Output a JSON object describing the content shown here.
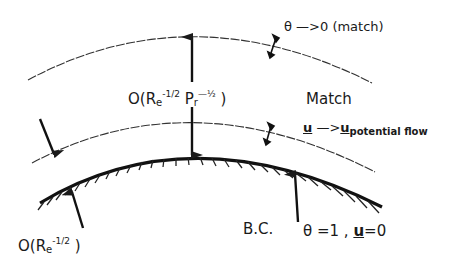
{
  "diagram": {
    "type": "boundary-layer schematic",
    "labels": {
      "outer_condition": "θ —>0 (match)",
      "thermal_thickness_prefix": "O(R",
      "thermal_thickness_sub": "e",
      "thermal_thickness_exp1": "-1/2",
      "thermal_thickness_mid": " P",
      "thermal_thickness_sub2": "r",
      "thermal_thickness_exp2": "—½",
      "thermal_thickness_suffix": " )",
      "match": "Match",
      "velocity_u": "u",
      "velocity_arrow": " —>",
      "velocity_u2": "u",
      "velocity_sub": "potential flow",
      "momentum_thickness_prefix": "O(R",
      "momentum_thickness_sub": "e",
      "momentum_thickness_exp": "-1/2",
      "momentum_thickness_suffix": " )",
      "bc": "B.C.",
      "bc_values_theta": "θ =1 , ",
      "bc_values_u": "u",
      "bc_values_rest": "=0"
    },
    "curves": [
      {
        "name": "thermal-layer-edge",
        "style": "dashed-thin"
      },
      {
        "name": "momentum-layer-edge",
        "style": "dashed-thin"
      },
      {
        "name": "wall-surface",
        "style": "solid-thick-hatched"
      }
    ],
    "colors": {
      "ink": "#1a1a1a",
      "background": "#ffffff"
    }
  }
}
